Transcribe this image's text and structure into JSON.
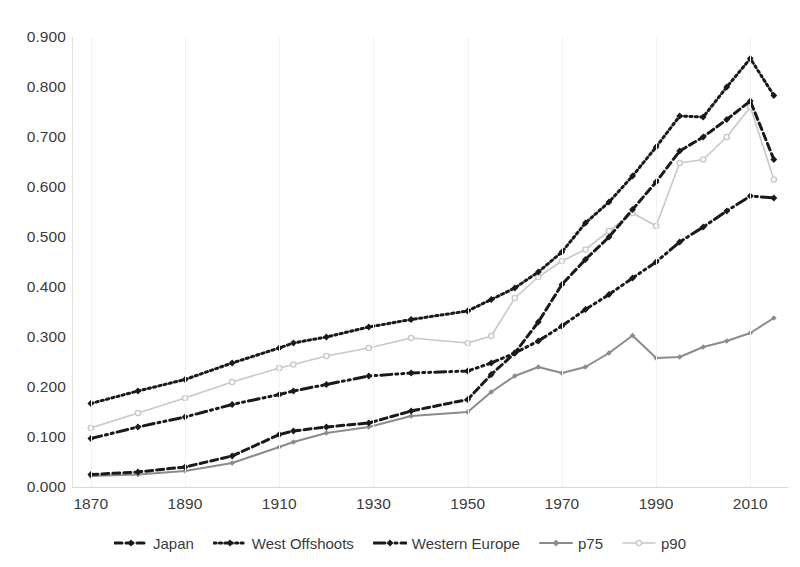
{
  "chart_data": {
    "type": "line",
    "title": "",
    "subtitle": "",
    "xlabel": "",
    "ylabel": "",
    "xlim": [
      1866,
      2018
    ],
    "ylim": [
      0.0,
      0.9
    ],
    "grid": true,
    "legend_position": "bottom",
    "x_ticks": [
      "1870",
      "1890",
      "1910",
      "1930",
      "1950",
      "1970",
      "1990",
      "2010"
    ],
    "x_tick_values": [
      1870,
      1890,
      1910,
      1930,
      1950,
      1970,
      1990,
      2010
    ],
    "y_ticks": [
      "0.000",
      "0.100",
      "0.200",
      "0.300",
      "0.400",
      "0.500",
      "0.600",
      "0.700",
      "0.800",
      "0.900"
    ],
    "y_tick_values": [
      0.0,
      0.1,
      0.2,
      0.3,
      0.4,
      0.5,
      0.6,
      0.7,
      0.8,
      0.9
    ],
    "series": [
      {
        "name": "Japan",
        "color": "#1a1a1a",
        "style": "dashed",
        "marker": "diamond",
        "x": [
          1870,
          1880,
          1890,
          1900,
          1910,
          1913,
          1920,
          1929,
          1938,
          1950,
          1955,
          1960,
          1965,
          1970,
          1975,
          1980,
          1985,
          1990,
          1995,
          2000,
          2005,
          2010,
          2015
        ],
        "y": [
          0.025,
          0.03,
          0.04,
          0.062,
          0.105,
          0.112,
          0.12,
          0.128,
          0.152,
          0.175,
          0.225,
          0.268,
          0.33,
          0.405,
          0.455,
          0.5,
          0.555,
          0.61,
          0.672,
          0.7,
          0.735,
          0.772,
          0.655
        ]
      },
      {
        "name": "West Offshoots",
        "color": "#1a1a1a",
        "style": "dotted",
        "marker": "diamond",
        "x": [
          1870,
          1880,
          1890,
          1900,
          1910,
          1913,
          1920,
          1929,
          1938,
          1950,
          1955,
          1960,
          1965,
          1970,
          1975,
          1980,
          1985,
          1990,
          1995,
          2000,
          2005,
          2010,
          2015
        ],
        "y": [
          0.167,
          0.192,
          0.215,
          0.248,
          0.278,
          0.288,
          0.3,
          0.32,
          0.335,
          0.352,
          0.375,
          0.398,
          0.43,
          0.47,
          0.528,
          0.57,
          0.622,
          0.68,
          0.742,
          0.74,
          0.8,
          0.857,
          0.783
        ]
      },
      {
        "name": "Western Europe",
        "color": "#1a1a1a",
        "style": "dashdot",
        "marker": "diamond",
        "x": [
          1870,
          1880,
          1890,
          1900,
          1910,
          1913,
          1920,
          1929,
          1938,
          1950,
          1955,
          1960,
          1965,
          1970,
          1975,
          1980,
          1985,
          1990,
          1995,
          2000,
          2005,
          2010,
          2015
        ],
        "y": [
          0.097,
          0.12,
          0.14,
          0.165,
          0.185,
          0.192,
          0.205,
          0.222,
          0.228,
          0.232,
          0.248,
          0.268,
          0.292,
          0.322,
          0.355,
          0.385,
          0.418,
          0.45,
          0.49,
          0.52,
          0.552,
          0.582,
          0.578
        ]
      },
      {
        "name": "p75",
        "color": "#8c8c8c",
        "style": "solid",
        "marker": "diamond",
        "x": [
          1870,
          1880,
          1890,
          1900,
          1910,
          1913,
          1920,
          1929,
          1938,
          1950,
          1955,
          1960,
          1965,
          1970,
          1975,
          1980,
          1985,
          1990,
          1995,
          2000,
          2005,
          2010,
          2015
        ],
        "y": [
          0.022,
          0.025,
          0.032,
          0.048,
          0.08,
          0.09,
          0.108,
          0.12,
          0.142,
          0.15,
          0.19,
          0.222,
          0.24,
          0.228,
          0.24,
          0.268,
          0.303,
          0.258,
          0.26,
          0.28,
          0.292,
          0.308,
          0.338
        ]
      },
      {
        "name": "p90",
        "color": "#c8c8c8",
        "style": "solid-light",
        "marker": "circle",
        "x": [
          1870,
          1880,
          1890,
          1900,
          1910,
          1913,
          1920,
          1929,
          1938,
          1950,
          1955,
          1960,
          1965,
          1970,
          1975,
          1980,
          1985,
          1990,
          1995,
          2000,
          2005,
          2010,
          2015
        ],
        "y": [
          0.118,
          0.148,
          0.178,
          0.21,
          0.238,
          0.245,
          0.262,
          0.278,
          0.298,
          0.288,
          0.302,
          0.378,
          0.42,
          0.452,
          0.475,
          0.512,
          0.548,
          0.522,
          0.648,
          0.655,
          0.7,
          0.76,
          0.615
        ]
      }
    ]
  },
  "legend": {
    "items": [
      {
        "label": "Japan"
      },
      {
        "label": "West Offshoots"
      },
      {
        "label": "Western Europe"
      },
      {
        "label": "p75"
      },
      {
        "label": "p90"
      }
    ]
  }
}
